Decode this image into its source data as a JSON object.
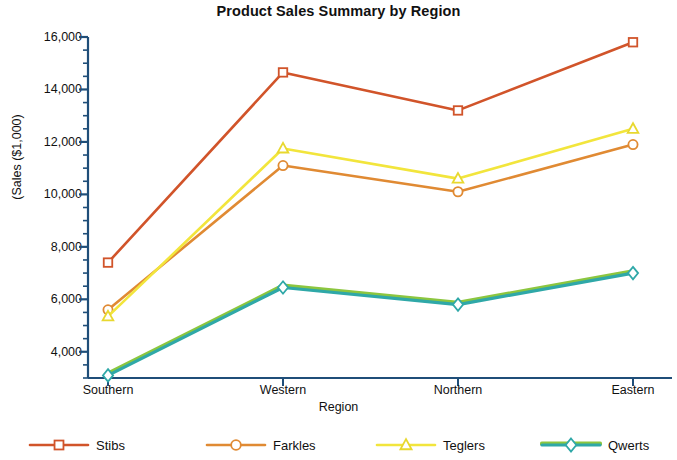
{
  "chart_data": {
    "type": "line",
    "title": "Product Sales Summary by Region",
    "xlabel": "Region",
    "ylabel": "(Sales ($1,000)",
    "categories": [
      "Southern",
      "Western",
      "Northern",
      "Eastern"
    ],
    "ylim": [
      3000,
      16000
    ],
    "yticks": [
      4000,
      6000,
      8000,
      10000,
      12000,
      14000,
      16000
    ],
    "ytick_labels": [
      "4,000",
      "6,000",
      "8,000",
      "10,000",
      "12,000",
      "14,000",
      "16,000"
    ],
    "minor_tick_interval": 500,
    "grid": false,
    "legend_position": "bottom",
    "series": [
      {
        "name": "Stibs",
        "values": [
          7400,
          14650,
          13200,
          15800
        ],
        "color": "#d1542a",
        "marker": "square",
        "marker_color": "#d1542a"
      },
      {
        "name": "Farkles",
        "values": [
          5600,
          11100,
          10100,
          11900
        ],
        "color": "#e08a33",
        "marker": "circle",
        "marker_color": "#e08a33"
      },
      {
        "name": "Teglers",
        "values": [
          5350,
          11750,
          10600,
          12500
        ],
        "color": "#f2e53c",
        "marker": "triangle",
        "marker_color": "#e8d82f"
      },
      {
        "name": "Qwerts",
        "values": [
          3100,
          6450,
          5800,
          7000
        ],
        "color": "#2fa8a8",
        "color_secondary": "#8cc63f",
        "marker": "diamond",
        "marker_color": "#2fa8a8"
      }
    ]
  },
  "axis": {
    "line_color": "#1f4e79",
    "tick_color": "#1f4e79"
  },
  "legend": {
    "items": [
      {
        "label": "Stibs"
      },
      {
        "label": "Farkles"
      },
      {
        "label": "Teglers"
      },
      {
        "label": "Qwerts"
      }
    ]
  }
}
